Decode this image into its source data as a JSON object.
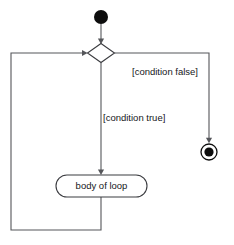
{
  "diagram": {
    "kind": "uml-activity-diagram",
    "title": "loop",
    "width": 234,
    "height": 245,
    "background_color": "#ffffff",
    "stroke_color": "#55565a",
    "node_stroke_color": "#3b3c40",
    "text_color": "#16171a",
    "nodes": [
      {
        "id": "initial",
        "type": "initial-node",
        "label": "",
        "cx": 101,
        "cy": 17,
        "r": 7,
        "fill": "#0d0d0d"
      },
      {
        "id": "decision",
        "type": "decision-node",
        "label": "",
        "cx": 101,
        "cy": 53,
        "half_width": 13.5,
        "half_height": 9.5
      },
      {
        "id": "body",
        "type": "action-node",
        "label": "body of loop",
        "x": 56,
        "y": 175,
        "width": 91,
        "height": 22,
        "corner_radius": 11
      },
      {
        "id": "final",
        "type": "final-node",
        "label": "",
        "cx": 209,
        "cy": 152,
        "outer_r": 8,
        "inner_r": 4.6,
        "fill": "#0d0d0d"
      }
    ],
    "edges": [
      {
        "id": "initial-to-decision",
        "from": "initial",
        "to": "decision",
        "label": "",
        "arrow": true
      },
      {
        "id": "decision-to-final",
        "from": "decision",
        "to": "final",
        "label": "[condition false]",
        "label_x": 132,
        "label_y": 72,
        "arrow": true
      },
      {
        "id": "decision-to-body",
        "from": "decision",
        "to": "body",
        "label": "[condition true]",
        "label_x": 103,
        "label_y": 118,
        "arrow": true
      },
      {
        "id": "body-to-decision",
        "from": "body",
        "to": "decision",
        "label": "",
        "arrow": true
      }
    ]
  }
}
